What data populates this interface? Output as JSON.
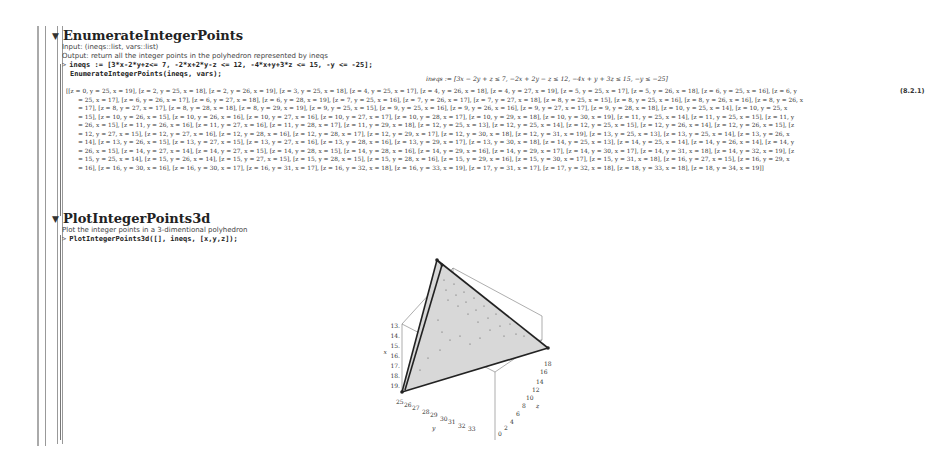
{
  "sections": [
    {
      "title": "EnumerateIntegerPoints",
      "description_lines": [
        "Input: (ineqs::list, vars::list)",
        "Output: return all the integer points in the polyhedron represented by ineqs"
      ],
      "commands": [
        "ineqs := [3*x-2*y+z<= 7, -2*x+2*y-z <= 12, -4*x+y+3*z <= 15, -y <= -25];",
        "EnumerateIntegerPoints(ineqs, vars);"
      ],
      "ineqs_output": "ineqs := [3x − 2y + z ≤ 7, −2x + 2y − z ≤ 12, −4x + y + 3z ≤ 15, −y ≤ −25]",
      "result_lines": [
        "[[z = 0, y = 25, x = 19], [z = 2, y = 25, x = 18], [z = 2, y = 26, x = 19], [z = 3, y = 25, x = 18], [z = 4, y = 25, x = 17], [z = 4, y = 26, x = 18], [z = 4, y = 27, x = 19], [z = 5, y = 25, x = 17], [z = 5, y = 26, x = 18], [z = 6, y = 25, x = 16], [z = 6, y",
        "= 25, x = 17], [z = 6, y = 26, x = 17], [z = 6, y = 27, x = 18], [z = 6, y = 28, x = 19], [z = 7, y = 25, x = 16], [z = 7, y = 26, x = 17], [z = 7, y = 27, x = 18], [z = 8, y = 25, x = 15], [z = 8, y = 25, x = 16], [z = 8, y = 26, x = 16], [z = 8, y = 26, x",
        "= 17], [z = 8, y = 27, x = 17], [z = 8, y = 28, x = 18], [z = 8, y = 29, x = 19], [z = 9, y = 25, x = 15], [z = 9, y = 25, x = 16], [z = 9, y = 26, x = 16], [z = 9, y = 27, x = 17], [z = 9, y = 28, x = 18], [z = 10, y = 25, x = 14], [z = 10, y = 25, x",
        "= 15], [z = 10, y = 26, x = 15], [z = 10, y = 26, x = 16], [z = 10, y = 27, x = 16], [z = 10, y = 27, x = 17], [z = 10, y = 28, x = 17], [z = 10, y = 29, x = 18], [z = 10, y = 30, x = 19], [z = 11, y = 25, x = 14], [z = 11, y = 25, x = 15], [z = 11, y",
        "= 26, x = 15], [z = 11, y = 26, x = 16], [z = 11, y = 27, x = 16], [z = 11, y = 28, x = 17], [z = 11, y = 29, x = 18], [z = 12, y = 25, x = 13], [z = 12, y = 25, x = 14], [z = 12, y = 25, x = 15], [z = 12, y = 26, x = 14], [z = 12, y = 26, x = 15], [z",
        "= 12, y = 27, x = 15], [z = 12, y = 27, x = 16], [z = 12, y = 28, x = 16], [z = 12, y = 28, x = 17], [z = 12, y = 29, x = 17], [z = 12, y = 30, x = 18], [z = 12, y = 31, x = 19], [z = 13, y = 25, x = 13], [z = 13, y = 25, x = 14], [z = 13, y = 26, x",
        "= 14], [z = 13, y = 26, x = 15], [z = 13, y = 27, x = 15], [z = 13, y = 27, x = 16], [z = 13, y = 28, x = 16], [z = 13, y = 29, x = 17], [z = 13, y = 30, x = 18], [z = 14, y = 25, x = 13], [z = 14, y = 25, x = 14], [z = 14, y = 26, x = 14], [z = 14, y",
        "= 26, x = 15], [z = 14, y = 27, x = 14], [z = 14, y = 27, x = 15], [z = 14, y = 28, x = 15], [z = 14, y = 28, x = 16], [z = 14, y = 29, x = 16], [z = 14, y = 29, x = 17], [z = 14, y = 30, x = 17], [z = 14, y = 31, x = 18], [z = 14, y = 32, x = 19], [z",
        "= 15, y = 25, x = 14], [z = 15, y = 26, x = 14], [z = 15, y = 27, x = 15], [z = 15, y = 28, x = 15], [z = 15, y = 28, x = 16], [z = 15, y = 29, x = 16], [z = 15, y = 30, x = 17], [z = 15, y = 31, x = 18], [z = 16, y = 27, x = 15], [z = 16, y = 29, x",
        "= 16], [z = 16, y = 30, x = 16], [z = 16, y = 30, x = 17], [z = 16, y = 31, x = 17], [z = 16, y = 32, x = 18], [z = 16, y = 33, x = 19], [z = 17, y = 31, x = 17], [z = 17, y = 32, x = 18], [z = 18, y = 33, x = 18], [z = 18, y = 34, x = 19]]"
      ],
      "equation_label": "(8.2.1)"
    },
    {
      "title": "PlotIntegerPoints3d",
      "description_lines": [
        "Plot the integer points in a 3-dimentional polyhedron"
      ],
      "commands": [
        "PlotIntegerPoints3d([], ineqs, [x,y,z]);"
      ]
    }
  ],
  "plot": {
    "x_axis_label": "x",
    "x_ticks": [
      "13.",
      "14.",
      "15.",
      "16.",
      "17.",
      "18.",
      "19."
    ],
    "y_axis_label": "y",
    "y_ticks": [
      "25",
      "26",
      "27",
      "28",
      "29",
      "30",
      "31",
      "32",
      "33"
    ],
    "z_axis_label": "z",
    "z_ticks": [
      "0",
      "2",
      "4",
      "6",
      "8",
      "10",
      "12",
      "14",
      "16",
      "18"
    ]
  },
  "prompt_symbol": ">",
  "collapse_icon": "▼"
}
